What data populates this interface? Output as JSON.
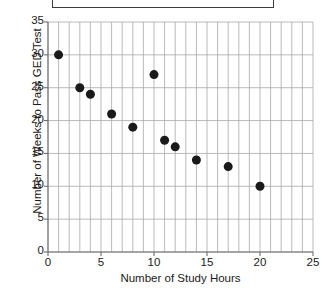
{
  "title_box": {
    "text": "",
    "border_color": "#3c3c3c"
  },
  "chart_data": {
    "type": "scatter",
    "title": "",
    "xlabel": "Number of Study Hours",
    "ylabel": "Number of Weeks to Pass GED Test",
    "xlim": [
      0,
      25
    ],
    "ylim": [
      0,
      35
    ],
    "xticks": [
      0,
      5,
      10,
      15,
      20,
      25
    ],
    "yticks": [
      0,
      5,
      10,
      15,
      20,
      25,
      30,
      35
    ],
    "xtick_labels": [
      "0",
      "5",
      "10",
      "15",
      "20",
      "25"
    ],
    "ytick_labels": [
      "0",
      "5",
      "10",
      "15",
      "20",
      "25",
      "30",
      "35"
    ],
    "grid": {
      "x_minor_step": 1,
      "y_major_step": 5,
      "color": "#a8a8a8",
      "visible": true
    },
    "legend": null,
    "marker": {
      "color": "#1a1a1a",
      "size_px": 9,
      "shape": "circle"
    },
    "points": [
      {
        "x": 1,
        "y": 30
      },
      {
        "x": 3,
        "y": 25
      },
      {
        "x": 4,
        "y": 24
      },
      {
        "x": 6,
        "y": 21
      },
      {
        "x": 8,
        "y": 19
      },
      {
        "x": 10,
        "y": 27
      },
      {
        "x": 11,
        "y": 17
      },
      {
        "x": 12,
        "y": 16
      },
      {
        "x": 14,
        "y": 14
      },
      {
        "x": 17,
        "y": 13
      },
      {
        "x": 20,
        "y": 10
      }
    ]
  }
}
